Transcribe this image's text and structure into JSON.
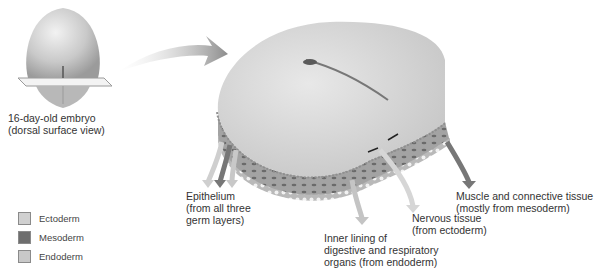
{
  "figure": {
    "embryo": {
      "caption_line1": "16-day-old embryo",
      "caption_line2": "(dorsal surface view)"
    },
    "labels": {
      "epithelium": [
        "Epithelium",
        "(from all three",
        "germ layers)"
      ],
      "inner_lining": [
        "Inner lining of",
        "digestive and respiratory",
        "organs (from endoderm)"
      ],
      "nervous": [
        "Nervous tissue",
        "(from ectoderm)"
      ],
      "muscle": [
        "Muscle and connective tissue",
        "(mostly from mesoderm)"
      ]
    },
    "legend": [
      {
        "label": "Ectoderm",
        "color": "#d0d0d0"
      },
      {
        "label": "Mesoderm",
        "color": "#6e6e6e"
      },
      {
        "label": "Endoderm",
        "color": "#c8c8c8"
      }
    ],
    "colors": {
      "ectoderm_arrow": "#cfcfcf",
      "mesoderm_arrow": "#777777",
      "endoderm_arrow": "#bdbdbd",
      "disc_top": "#d9d9d9",
      "tissue_body": "#9a9a9a"
    }
  }
}
